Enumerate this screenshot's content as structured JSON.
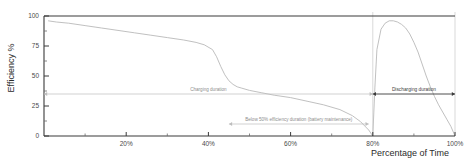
{
  "chart_data": {
    "type": "line",
    "title": "",
    "xlabel": "Percentage of Time",
    "ylabel": "Efficiency %",
    "xlim": [
      0,
      100
    ],
    "ylim": [
      0,
      100
    ],
    "grid": false,
    "legend": "none",
    "x_ticks": [
      20,
      40,
      60,
      80,
      100
    ],
    "x_tick_labels": [
      "20%",
      "40%",
      "60%",
      "80%",
      "100%"
    ],
    "x_minor_ticks": [
      10,
      30,
      50,
      70,
      90
    ],
    "y_ticks": [
      0,
      25,
      50,
      75,
      100
    ],
    "y_tick_labels": [
      "0",
      "25",
      "50",
      "75",
      "100"
    ],
    "y_minor_ticks": [
      12.5,
      37.5,
      62.5,
      87.5
    ],
    "series": [
      {
        "name": "charging-efficiency",
        "color": "#b9b9b9",
        "x": [
          1,
          3,
          6,
          10,
          14,
          18,
          22,
          26,
          30,
          34,
          37,
          39,
          41,
          42,
          43,
          44,
          45,
          46,
          47,
          48,
          50,
          53,
          56,
          60,
          64,
          68,
          72,
          75,
          77,
          79,
          80
        ],
        "y": [
          96,
          95,
          94,
          92,
          90,
          88,
          86,
          84,
          82,
          80,
          78,
          76,
          72,
          66,
          58,
          51,
          46,
          43,
          41,
          40,
          38,
          36,
          34,
          32,
          29,
          26,
          22,
          17,
          12,
          5,
          0
        ]
      },
      {
        "name": "discharging-efficiency",
        "color": "#b9b9b9",
        "x": [
          80,
          80.5,
          81,
          82,
          83,
          84,
          85,
          86,
          87,
          88,
          89,
          90,
          91,
          92,
          93,
          94,
          95,
          96,
          97,
          98,
          99,
          100
        ],
        "y": [
          0,
          40,
          72,
          89,
          94,
          96,
          96,
          95,
          93,
          90,
          85,
          78,
          70,
          60,
          50,
          41,
          33,
          26,
          20,
          14,
          8,
          0
        ]
      }
    ],
    "annotations": [
      {
        "name": "charging-duration",
        "label": "Charging duration",
        "x_start": 0,
        "x_end": 80,
        "y": 35,
        "style": "light"
      },
      {
        "name": "below-50-efficiency-duration",
        "label": "Below 50% efficiency duration (battery maintenance)",
        "x_start": 45,
        "x_end": 79,
        "y": 10,
        "style": "light"
      },
      {
        "name": "discharging-duration",
        "label": "Discharging duration",
        "x_start": 80,
        "x_end": 100,
        "y": 35,
        "style": "dark"
      }
    ],
    "dividers": [
      {
        "name": "phase-divider-80",
        "x": 80
      },
      {
        "name": "phase-divider-100",
        "x": 100
      }
    ]
  }
}
